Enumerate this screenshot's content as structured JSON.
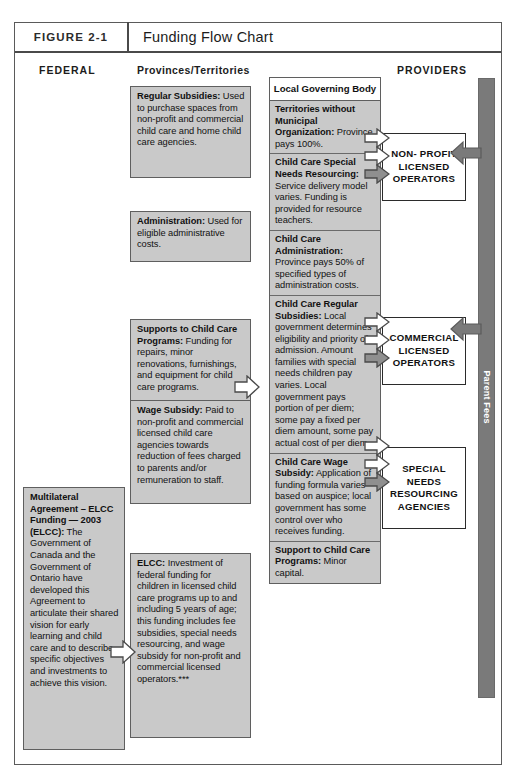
{
  "figure": {
    "number": "FIGURE 2-1",
    "title": "Funding Flow Chart"
  },
  "columns": {
    "federal": "FEDERAL",
    "provinces": "Provinces/Territories",
    "providers": "PROVIDERS"
  },
  "federal_boxes": [
    {
      "heading": "Multilateral Agreement – ELCC Funding — 2003 (ELCC):",
      "body": " The Government of Canada and the Government of Ontario have developed this Agreement to articulate their shared vision for early learning and child care and to describe specific objectives and investments to achieve this vision."
    }
  ],
  "province_boxes": [
    {
      "heading": "Regular Subsidies:",
      "body": " Used to purchase spaces from non-profit and commercial child care and home child care agencies."
    },
    {
      "heading": "Administration:",
      "body": " Used for eligible administrative costs."
    },
    {
      "heading": "Supports to Child Care Programs:",
      "body": " Funding for repairs, minor renovations, furnishings, and equipment for child care programs."
    },
    {
      "heading": "Wage Subsidy:",
      "body": " Paid to non-profit and commercial licensed child care agencies towards reduction of fees charged to parents and/or remuneration to staff."
    },
    {
      "heading": "ELCC:",
      "body": " Investment of federal funding for children in licensed child care programs up to and including 5 years of age; this funding includes fee subsidies, special needs resourcing, and wage subsidy for non-profit and commercial licensed operators.***"
    }
  ],
  "local_governing_body": {
    "title": "Local Governing Body",
    "cells": [
      {
        "heading": "Territories without Municipal Organization:",
        "body": " Province pays 100%."
      },
      {
        "heading": "Child Care Special Needs Resourcing:",
        "body": " Service delivery model varies. Funding is provided for resource teachers."
      },
      {
        "heading": "Child Care Administration:",
        "body": " Province pays 50% of specified types of administration costs."
      },
      {
        "heading": "Child Care Regular Subsidies:",
        "body": " Local government determines eligibility and priority of admission. Amount families with special needs children pay varies. Local government pays portion of per diem; some pay a fixed per diem amount, some pay actual cost of per diem."
      },
      {
        "heading": "Child Care Wage Subsidy:",
        "body": " Application of funding formula varies based on auspice; local government has some control over who receives funding."
      },
      {
        "heading": "Support to Child Care Programs:",
        "body": " Minor capital."
      }
    ]
  },
  "provider_boxes": [
    {
      "label": "NON- PROFIT\nLICENSED\nOPERATORS"
    },
    {
      "label": "COMMERCIAL\nLICENSED\nOPERATORS"
    },
    {
      "label": "SPECIAL\nNEEDS\nRESOURCING\nAGENCIES"
    }
  ],
  "parent_fees": {
    "label": "Parent Fees"
  },
  "colors": {
    "box_fill": "#c9c9c9",
    "box_border": "#5f5f5f",
    "bar_fill": "#7a7a7a",
    "arrow_fill": "#ffffff",
    "arrow_fill_solid": "#8a8a8a",
    "text": "#111111"
  }
}
